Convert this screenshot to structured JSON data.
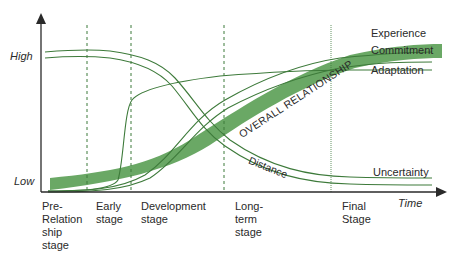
{
  "axes": {
    "y_high_label": "High",
    "y_low_label": "Low",
    "x_label": "Time"
  },
  "stages": [
    {
      "label": "Pre-\nRelation\nship\nstage"
    },
    {
      "label": "Early\nstage"
    },
    {
      "label": "Development\nstage"
    },
    {
      "label": "Long-\nterm\nstage"
    },
    {
      "label": "Final\nStage"
    }
  ],
  "curves": {
    "experience": "Experience",
    "commitment": "Commitment",
    "adaptation": "Adaptation",
    "uncertainty": "Uncertainty",
    "distance": "Distance",
    "overall": "OVERALL RELATIONSHIP"
  },
  "colors": {
    "band": "#6aa865",
    "line": "#3d7a3a",
    "axis": "#2a2a2a"
  }
}
